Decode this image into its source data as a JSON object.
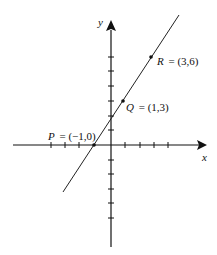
{
  "diagram": {
    "type": "coordinate-plane",
    "axes": {
      "x_label": "x",
      "y_label": "y",
      "x_ticks_left": 4,
      "x_ticks_right": 4,
      "y_ticks_up": 6,
      "y_ticks_down": 5
    },
    "line": {
      "description": "line through P, Q, R",
      "slope": 1.5
    },
    "points": [
      {
        "name": "P",
        "label": "P = (−1,0)",
        "var": "P",
        "coords": "= (−1,0)",
        "x": -1,
        "y": 0
      },
      {
        "name": "Q",
        "label": "Q = (1,3)",
        "var": "Q",
        "coords": "= (1,3)",
        "x": 1,
        "y": 3
      },
      {
        "name": "R",
        "label": "R = (3,6)",
        "var": "R",
        "coords": "= (3,6)",
        "x": 3,
        "y": 6
      }
    ],
    "colors": {
      "ink": "#111111",
      "background": "#ffffff"
    }
  }
}
